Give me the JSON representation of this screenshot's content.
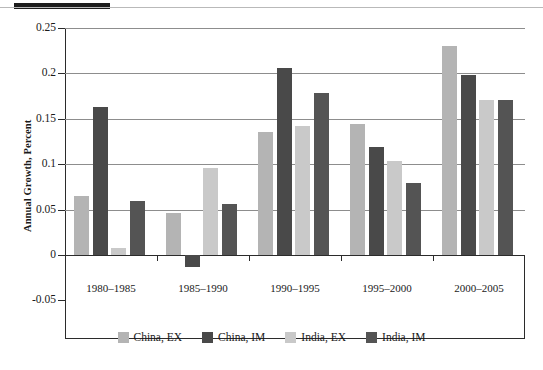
{
  "figure": {
    "top_black_bar": true,
    "caption_partial": "Figure 1 (caption cropped)"
  },
  "chart_data": {
    "type": "bar",
    "title": "",
    "xlabel": "",
    "ylabel": "Annual Growth, Percent",
    "ylim": [
      -0.05,
      0.25
    ],
    "yticks": [
      0.25,
      0.2,
      0.15,
      0.1,
      0.05,
      0,
      -0.05
    ],
    "ytick_labels": [
      "0.25",
      "0.2",
      "0.15",
      "0.1",
      "0.05",
      "0",
      "-0.05"
    ],
    "grid": true,
    "grid_axis": "y",
    "legend_position": "bottom",
    "categories": [
      "1980–1985",
      "1985–1990",
      "1990–1995",
      "1995–2000",
      "2000–2005"
    ],
    "series": [
      {
        "name": "China, EX",
        "color": "#b4b4b4",
        "values": [
          0.065,
          0.046,
          0.136,
          0.144,
          0.23
        ]
      },
      {
        "name": "China, IM",
        "color": "#494949",
        "values": [
          0.163,
          -0.013,
          0.206,
          0.119,
          0.198
        ]
      },
      {
        "name": "India, EX",
        "color": "#c9c9c9",
        "values": [
          0.008,
          0.096,
          0.142,
          0.103,
          0.171
        ]
      },
      {
        "name": "India, IM",
        "color": "#545454",
        "values": [
          0.06,
          0.056,
          0.178,
          0.079,
          0.171
        ]
      }
    ]
  },
  "colors": {
    "axis": "#2b2b2b",
    "grid": "#8d8d8d",
    "background": "#ffffff"
  }
}
